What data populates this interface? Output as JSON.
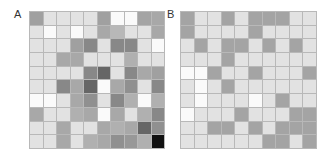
{
  "panels": [
    {
      "label": "A",
      "rows": 10,
      "cols": 10,
      "cells": [
        [
          "#a0a0a0",
          "#e2e2e2",
          "#e2e2e2",
          "#e2e2e2",
          "#e2e2e2",
          "#a0a0a0",
          "#fafafa",
          "#fafafa",
          "#a4a4a4",
          "#a8a8a8"
        ],
        [
          "#e2e2e2",
          "#fafafa",
          "#e2e2e2",
          "#fafafa",
          "#e2e2e2",
          "#a8a8a8",
          "#b8b8b8",
          "#e2e2e2",
          "#e2e2e2",
          "#a8a8a8"
        ],
        [
          "#e2e2e2",
          "#e2e2e2",
          "#e2e2e2",
          "#a0a0a0",
          "#888888",
          "#e2e2e2",
          "#888888",
          "#888888",
          "#e2e2e2",
          "#fafafa"
        ],
        [
          "#e2e2e2",
          "#e2e2e2",
          "#a8a8a8",
          "#a8a8a8",
          "#e2e2e2",
          "#e2e2e2",
          "#e2e2e2",
          "#b0b0b0",
          "#e2e2e2",
          "#e2e2e2"
        ],
        [
          "#e2e2e2",
          "#e2e2e2",
          "#e2e2e2",
          "#e2e2e2",
          "#888888",
          "#666666",
          "#e2e2e2",
          "#888888",
          "#a8a8a8",
          "#a0a0a0"
        ],
        [
          "#e2e2e2",
          "#e2e2e2",
          "#888888",
          "#a8a8a8",
          "#666666",
          "#fafafa",
          "#a8a8a8",
          "#909090",
          "#e2e2e2",
          "#888888"
        ],
        [
          "#fafafa",
          "#fafafa",
          "#e2e2e2",
          "#a8a8a8",
          "#909090",
          "#e2e2e2",
          "#888888",
          "#b0b0b0",
          "#fafafa",
          "#b0b0b0"
        ],
        [
          "#a8a8a8",
          "#e2e2e2",
          "#e2e2e2",
          "#b0b0b0",
          "#a8a8a8",
          "#fafafa",
          "#a8a8a8",
          "#e2e2e2",
          "#b0b0b0",
          "#888888"
        ],
        [
          "#e2e2e2",
          "#e2e2e2",
          "#a8a8a8",
          "#e2e2e2",
          "#e2e2e2",
          "#a8a8a8",
          "#b0b0b0",
          "#a8a8a8",
          "#666666",
          "#909090"
        ],
        [
          "#e2e2e2",
          "#e2e2e2",
          "#a8a8a8",
          "#e2e2e2",
          "#b0b0b0",
          "#a8a8a8",
          "#909090",
          "#989898",
          "#b0b0b0",
          "#111111"
        ]
      ]
    },
    {
      "label": "B",
      "rows": 10,
      "cols": 10,
      "cells": [
        [
          "#a4a4a4",
          "#e2e2e2",
          "#e2e2e2",
          "#a4a4a4",
          "#e2e2e2",
          "#a4a4a4",
          "#a4a4a4",
          "#a4a4a4",
          "#e2e2e2",
          "#e2e2e2"
        ],
        [
          "#a4a4a4",
          "#e2e2e2",
          "#e2e2e2",
          "#e2e2e2",
          "#e2e2e2",
          "#a4a4a4",
          "#e2e2e2",
          "#e2e2e2",
          "#e2e2e2",
          "#e2e2e2"
        ],
        [
          "#e2e2e2",
          "#a4a4a4",
          "#e2e2e2",
          "#a4a4a4",
          "#a4a4a4",
          "#e2e2e2",
          "#a4a4a4",
          "#e2e2e2",
          "#a4a4a4",
          "#e2e2e2"
        ],
        [
          "#e2e2e2",
          "#e2e2e2",
          "#e2e2e2",
          "#a4a4a4",
          "#e2e2e2",
          "#e2e2e2",
          "#e2e2e2",
          "#e2e2e2",
          "#e2e2e2",
          "#e2e2e2"
        ],
        [
          "#fafafa",
          "#fafafa",
          "#a4a4a4",
          "#e2e2e2",
          "#e2e2e2",
          "#a4a4a4",
          "#e2e2e2",
          "#e2e2e2",
          "#e2e2e2",
          "#a4a4a4"
        ],
        [
          "#e2e2e2",
          "#fafafa",
          "#e2e2e2",
          "#a4a4a4",
          "#e2e2e2",
          "#e2e2e2",
          "#e2e2e2",
          "#e2e2e2",
          "#e2e2e2",
          "#e2e2e2"
        ],
        [
          "#e2e2e2",
          "#fafafa",
          "#e2e2e2",
          "#e2e2e2",
          "#e2e2e2",
          "#fafafa",
          "#e2e2e2",
          "#a4a4a4",
          "#e2e2e2",
          "#e2e2e2"
        ],
        [
          "#fafafa",
          "#e2e2e2",
          "#e2e2e2",
          "#e2e2e2",
          "#a4a4a4",
          "#e2e2e2",
          "#e2e2e2",
          "#e2e2e2",
          "#a4a4a4",
          "#a4a4a4"
        ],
        [
          "#e2e2e2",
          "#e2e2e2",
          "#a4a4a4",
          "#a4a4a4",
          "#e2e2e2",
          "#a4a4a4",
          "#e2e2e2",
          "#a4a4a4",
          "#a4a4a4",
          "#a4a4a4"
        ],
        [
          "#e2e2e2",
          "#e2e2e2",
          "#e2e2e2",
          "#e2e2e2",
          "#e2e2e2",
          "#e2e2e2",
          "#a4a4a4",
          "#a4a4a4",
          "#e2e2e2",
          "#a4a4a4"
        ]
      ]
    }
  ],
  "chart_data": [
    {
      "type": "heatmap",
      "title": "A",
      "xlabel": "",
      "ylabel": "",
      "rows": 10,
      "cols": 10,
      "colormap": "grayscale (lighter = lower, darker = higher)",
      "grid": true,
      "values": [
        [
          5,
          1,
          1,
          1,
          1,
          5,
          0,
          0,
          5,
          4
        ],
        [
          1,
          0,
          1,
          0,
          1,
          4,
          3,
          1,
          1,
          4
        ],
        [
          1,
          1,
          1,
          5,
          6,
          1,
          6,
          6,
          1,
          0
        ],
        [
          1,
          1,
          4,
          4,
          1,
          1,
          1,
          4,
          1,
          1
        ],
        [
          1,
          1,
          1,
          1,
          6,
          7,
          1,
          6,
          4,
          5
        ],
        [
          1,
          1,
          6,
          4,
          7,
          0,
          4,
          6,
          1,
          6
        ],
        [
          0,
          0,
          1,
          4,
          6,
          1,
          6,
          4,
          0,
          4
        ],
        [
          4,
          1,
          1,
          4,
          4,
          0,
          4,
          1,
          4,
          6
        ],
        [
          1,
          1,
          4,
          1,
          1,
          4,
          4,
          4,
          7,
          6
        ],
        [
          1,
          1,
          4,
          1,
          4,
          4,
          6,
          5,
          4,
          10
        ]
      ]
    },
    {
      "type": "heatmap",
      "title": "B",
      "xlabel": "",
      "ylabel": "",
      "rows": 10,
      "cols": 10,
      "colormap": "grayscale (3 levels: white, light gray, mid gray)",
      "grid": true,
      "values": [
        [
          2,
          1,
          1,
          2,
          1,
          2,
          2,
          2,
          1,
          1
        ],
        [
          2,
          1,
          1,
          1,
          1,
          2,
          1,
          1,
          1,
          1
        ],
        [
          1,
          2,
          1,
          2,
          2,
          1,
          2,
          1,
          2,
          1
        ],
        [
          1,
          1,
          1,
          2,
          1,
          1,
          1,
          1,
          1,
          1
        ],
        [
          0,
          0,
          2,
          1,
          1,
          2,
          1,
          1,
          1,
          2
        ],
        [
          1,
          0,
          1,
          2,
          1,
          1,
          1,
          1,
          1,
          1
        ],
        [
          1,
          0,
          1,
          1,
          1,
          0,
          1,
          2,
          1,
          1
        ],
        [
          0,
          1,
          1,
          1,
          2,
          1,
          1,
          1,
          2,
          2
        ],
        [
          1,
          1,
          2,
          2,
          1,
          2,
          1,
          2,
          2,
          2
        ],
        [
          1,
          1,
          1,
          1,
          1,
          1,
          2,
          2,
          1,
          2
        ]
      ]
    }
  ]
}
